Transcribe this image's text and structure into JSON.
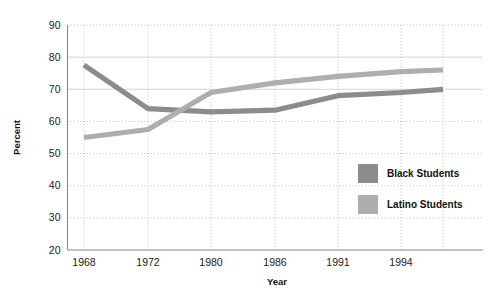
{
  "chart_data": {
    "type": "line",
    "title": "",
    "xlabel": "Year",
    "ylabel": "Percent",
    "categories": [
      "1968",
      "1972",
      "1980",
      "1986",
      "1991",
      "1994",
      ""
    ],
    "x_tick_labels": [
      "1968",
      "1972",
      "1980",
      "1986",
      "1991",
      "1994"
    ],
    "y_tick_labels": [
      "20",
      "30",
      "40",
      "50",
      "60",
      "70",
      "80",
      "90"
    ],
    "ylim": [
      20,
      90
    ],
    "grid": "dotted-both-axes",
    "legend_position": "inside-right-lower",
    "series": [
      {
        "name": "Black Students",
        "color": "#8c8c8c",
        "values": [
          77.5,
          64.0,
          63.0,
          63.5,
          68.0,
          69.0,
          70.0
        ]
      },
      {
        "name": "Latino Students",
        "color": "#aeaeae",
        "values": [
          55.0,
          57.5,
          69.0,
          72.0,
          74.0,
          75.5,
          76.0
        ]
      }
    ]
  },
  "legend": {
    "items": [
      {
        "label": "Black Students",
        "color": "#8c8c8c"
      },
      {
        "label": "Latino Students",
        "color": "#aeaeae"
      }
    ]
  },
  "colors": {
    "background": "#ffffff",
    "axis": "#8a8a8a",
    "grid_dotted": "#bdbdbd",
    "grid_solid": "#d6d6d6",
    "text": "#1a1a1a",
    "series_black_students": "#8c8c8c",
    "series_latino_students": "#aeaeae"
  }
}
